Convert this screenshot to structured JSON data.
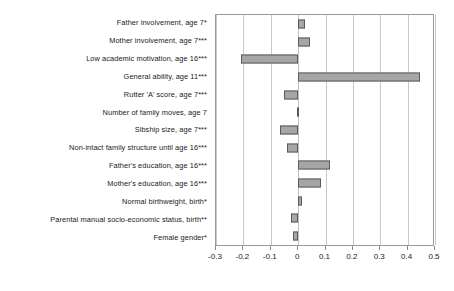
{
  "chart_data": {
    "type": "bar",
    "orientation": "horizontal",
    "title": "",
    "xlabel": "",
    "ylabel": "",
    "xlim": [
      -0.3,
      0.5
    ],
    "xticks": [
      -0.3,
      -0.2,
      -0.1,
      0,
      0.1,
      0.2,
      0.3,
      0.4,
      0.5
    ],
    "xticklabels": [
      "-0.3",
      "-0.2",
      "-0.1",
      "0",
      "0.1",
      "0.2",
      "0.3",
      "0.4",
      "0.5"
    ],
    "grid": "vertical",
    "legend": "none",
    "bar_color": "#a6a6a6",
    "bar_border_color": "#5a5a5a",
    "categories": [
      "Father involvement, age 7*",
      "Mother involvement, age 7***",
      "Low academic motivation, age 16***",
      "General ability, age 11***",
      "Rutter 'A' score, age 7***",
      "Number of family moves, age 7",
      "Sibship size, age 7***",
      "Non-intact family structure until age 16***",
      "Father's education, age 16***",
      "Mother's education, age 16***",
      "Normal birthweight, birth*",
      "Parental manual socio-economic status, birth**",
      "Female gender*"
    ],
    "values": [
      0.025,
      0.045,
      -0.21,
      0.445,
      -0.05,
      -0.005,
      -0.065,
      -0.04,
      0.115,
      0.085,
      0.015,
      -0.025,
      -0.02
    ]
  }
}
